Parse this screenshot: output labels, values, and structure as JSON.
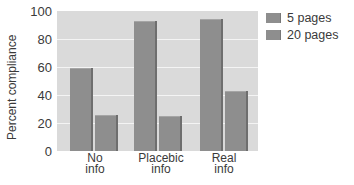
{
  "chart_data": {
    "type": "bar",
    "title": "",
    "xlabel": "",
    "ylabel": "Percent compliance",
    "ylim": [
      0,
      100
    ],
    "yticks": [
      0,
      20,
      40,
      60,
      80,
      100
    ],
    "grid": true,
    "legend_position": "right-top",
    "categories": [
      "No info",
      "Placebic info",
      "Real info"
    ],
    "category_lines": [
      [
        "No",
        "info"
      ],
      [
        "Placebic",
        "info"
      ],
      [
        "Real",
        "info"
      ]
    ],
    "series": [
      {
        "name": "5 pages",
        "values": [
          59,
          93,
          94
        ],
        "color": "#8e8e8e"
      },
      {
        "name": "20 pages",
        "values": [
          26,
          25,
          43
        ],
        "color": "#8e8e8e"
      }
    ]
  },
  "colors": {
    "plot_background": "#dadada",
    "gridline": "#f4f4f4",
    "bar": "#8e8e8e"
  }
}
